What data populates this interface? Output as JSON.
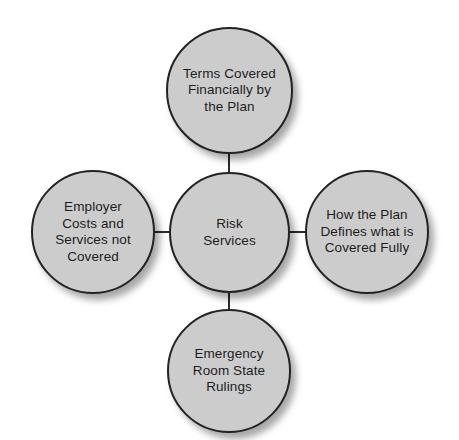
{
  "diagram": {
    "type": "hub-and-spoke",
    "title": "Risk Services",
    "style": {
      "node_fill": "#cccccc",
      "node_stroke": "#232323",
      "connector_color": "#2b2b2b",
      "text_color": "#1c1c1c",
      "background": "#ffffff"
    },
    "center": {
      "id": "center",
      "label": "Risk\nServices",
      "position": "center"
    },
    "nodes": [
      {
        "id": "top",
        "label": "Terms Covered\nFinancially by\nthe Plan",
        "position": "top"
      },
      {
        "id": "left",
        "label": "Employer\nCosts and\nServices not\nCovered",
        "position": "left"
      },
      {
        "id": "right",
        "label": "How the Plan\nDefines what is\nCovered Fully",
        "position": "right"
      },
      {
        "id": "bottom",
        "label": "Emergency\nRoom State\nRulings",
        "position": "bottom"
      }
    ],
    "connectors": [
      {
        "id": "center-top",
        "from": "center",
        "to": "top"
      },
      {
        "id": "center-left",
        "from": "center",
        "to": "left"
      },
      {
        "id": "center-right",
        "from": "center",
        "to": "right"
      },
      {
        "id": "center-bottom",
        "from": "center",
        "to": "bottom"
      }
    ]
  }
}
